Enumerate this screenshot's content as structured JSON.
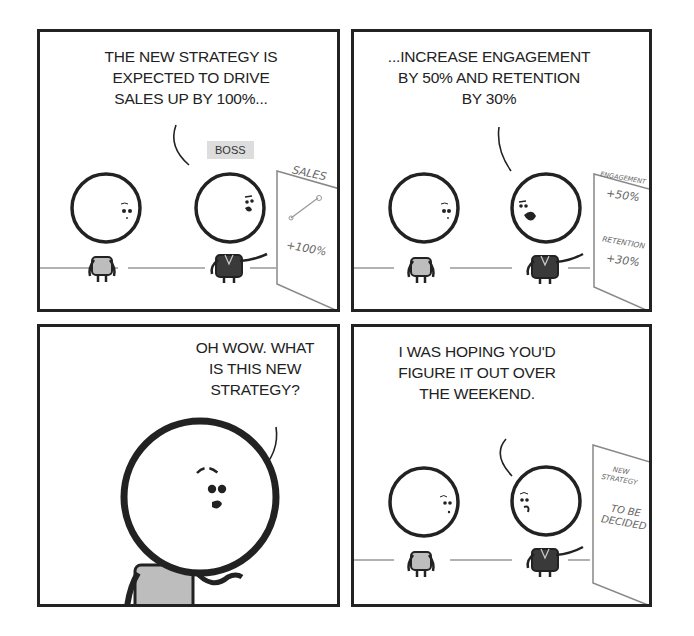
{
  "comic": {
    "panels": [
      {
        "id": 1,
        "speaker": "boss",
        "speech": [
          "THE NEW STRATEGY IS",
          "EXPECTED TO DRIVE",
          "SALES UP BY 100%..."
        ],
        "character_label": "BOSS",
        "board": {
          "title": "SALES",
          "value": "+100%",
          "graph": "rising-line"
        }
      },
      {
        "id": 2,
        "speaker": "boss",
        "speech": [
          "...INCREASE ENGAGEMENT",
          "BY 50% AND RETENTION",
          "BY 30%"
        ],
        "board": {
          "line1_label": "ENGAGEMENT",
          "line1_value": "+50%",
          "line2_label": "RETENTION",
          "line2_value": "+30%"
        }
      },
      {
        "id": 3,
        "speaker": "employee",
        "speech": [
          "OH WOW. WHAT",
          "IS THIS NEW",
          "STRATEGY?"
        ]
      },
      {
        "id": 4,
        "speaker": "boss",
        "speech": [
          "I WAS HOPING YOU'D",
          "FIGURE IT OUT OVER",
          "THE WEEKEND."
        ],
        "board": {
          "title_line1": "NEW",
          "title_line2": "STRATEGY",
          "value_line1": "TO BE",
          "value_line2": "DECIDED"
        }
      }
    ],
    "colors": {
      "ink": "#222222",
      "shirt": "#bdbdbd",
      "suit": "#3a3a3a",
      "label_bg": "#dddddd",
      "board_ink": "#666666"
    }
  }
}
